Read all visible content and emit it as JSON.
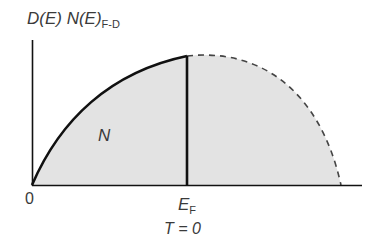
{
  "diagram": {
    "y_label_main": "D(E) N(E)",
    "y_label_sub": "F-D",
    "region_label": "N",
    "x_origin_label": "0",
    "fermi_label_main": "E",
    "fermi_label_sub": "F",
    "condition_label": "T = 0",
    "colors": {
      "fill": "#e3e3e3",
      "stroke": "#111111",
      "text": "#3a3a3a",
      "dashed": "#444444"
    },
    "curves": [
      {
        "name": "density-of-states-occupied",
        "style": "solid",
        "description": "sqrt-like rise from 0 to E_F"
      },
      {
        "name": "density-of-states-unoccupied",
        "style": "dashed",
        "description": "continuation beyond E_F falling to zero"
      }
    ]
  }
}
